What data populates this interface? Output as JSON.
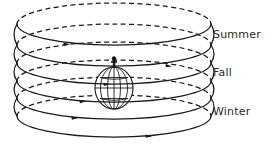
{
  "diagram": {
    "background_color": "#ffffff",
    "line_color": "#1a1a1a",
    "text_color": "#2b2b2b",
    "labels": [
      {
        "id": "summer",
        "text": "Summer",
        "x": 213,
        "y": 38
      },
      {
        "id": "fall",
        "text": "Fall",
        "x": 213,
        "y": 76
      },
      {
        "id": "winter",
        "text": "Winter",
        "x": 213,
        "y": 115
      }
    ],
    "globe": {
      "name": "earth-globe",
      "center_x": 114,
      "center_y": 88,
      "radius_x": 19,
      "radius_y": 21,
      "meridian_count": 4,
      "parallel_count": 3
    },
    "observer": {
      "name": "observer-figure",
      "x": 114,
      "y": 63,
      "description": "small standing human figure atop the globe"
    },
    "helix": {
      "name": "solar-path-helix",
      "turns": 6,
      "center_x": 114,
      "top_y": 16,
      "bottom_y": 140,
      "radius_x": 97,
      "radius_y": 21,
      "front_style": "solid",
      "back_style": "dashed",
      "direction": "rightward",
      "arrow_count": 6
    }
  }
}
